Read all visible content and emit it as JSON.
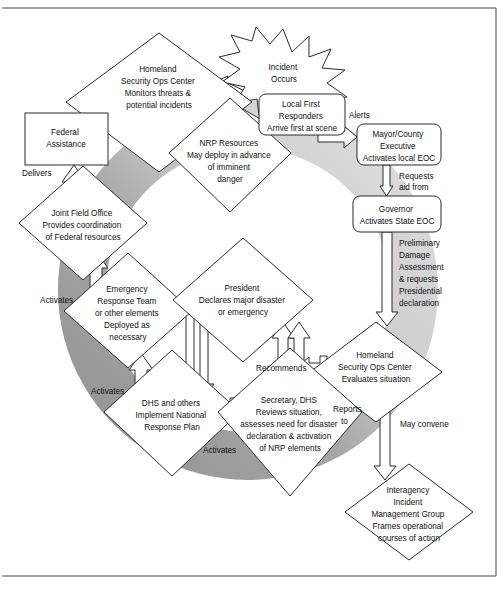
{
  "diagram": {
    "colors": {
      "ring_dark": "#8e8e8e",
      "ring_light": "#d8d8d8",
      "ring_mid": "#bdbdbd",
      "stroke": "#2b2b2b",
      "fill": "#ffffff",
      "text": "#111111"
    },
    "nodes": {
      "incident": {
        "shape": "star",
        "lines": [
          "Incident",
          "Occurs"
        ]
      },
      "hsoc_monitor": {
        "shape": "diamond",
        "lines": [
          "Homeland",
          "Security Ops Center",
          "Monitors threats &",
          "potential incidents"
        ]
      },
      "nrp_resources": {
        "shape": "diamond",
        "lines": [
          "NRP Resources",
          "May deploy in advance",
          "of imminent",
          "danger"
        ]
      },
      "local_first_responders": {
        "shape": "rounded-rect",
        "lines": [
          "Local First",
          "Responders",
          "Arrive first at scene"
        ]
      },
      "mayor_county": {
        "shape": "rounded-rect",
        "lines": [
          "Mayor/County",
          "Executive",
          "Activates local EOC"
        ]
      },
      "governor": {
        "shape": "rounded-rect",
        "lines": [
          "Governor",
          "Activates State EOC"
        ]
      },
      "federal_assistance": {
        "shape": "rect",
        "lines": [
          "Federal",
          "Assistance"
        ]
      },
      "joint_field_office": {
        "shape": "diamond",
        "lines": [
          "Joint Field Office",
          "Provides coordination",
          "of Federal resources"
        ]
      },
      "emergency_response_team": {
        "shape": "diamond",
        "lines": [
          "Emergency",
          "Response Team",
          "or other elements",
          "Deployed as",
          "necessary"
        ]
      },
      "president": {
        "shape": "diamond",
        "lines": [
          "President",
          "Declares major disaster",
          "or emergency"
        ]
      },
      "hsoc_evaluate": {
        "shape": "diamond",
        "lines": [
          "Homeland",
          "Security Ops Center",
          "Evaluates situation"
        ]
      },
      "dhs_implement": {
        "shape": "diamond",
        "lines": [
          "DHS and others",
          "Implement National",
          "Response Plan"
        ]
      },
      "secretary_dhs": {
        "shape": "diamond",
        "lines": [
          "Secretary, DHS",
          "Reviews situation,",
          "assesses need for disaster",
          "declaration & activation",
          "of NRP elements"
        ]
      },
      "iimg": {
        "shape": "diamond",
        "lines": [
          "Interagency",
          "Incident",
          "Management Group",
          "Frames operational",
          "courses of action"
        ]
      }
    },
    "edge_labels": {
      "alerts": "Alerts",
      "requests_aid_from": [
        "Requests",
        "aid from"
      ],
      "preliminary_damage": [
        "Preliminary",
        "Damage",
        "Assessment",
        "& requests",
        "Presidential",
        "declaration"
      ],
      "delivers": "Delivers",
      "activates_jfo": "Activates",
      "activates_ert": "Activates",
      "activates_dhs": "Activates",
      "recommends": "Recommends",
      "reports_to": [
        "Reports",
        "to"
      ],
      "may_convene": "May convene"
    }
  }
}
